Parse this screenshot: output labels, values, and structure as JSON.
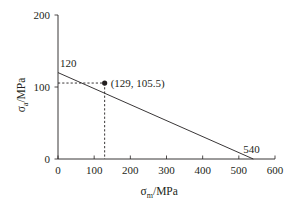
{
  "chart_data": {
    "type": "line",
    "title": "",
    "xlabel": "σm/MPa",
    "ylabel": "σa/MPa",
    "xlabel_main": "σ",
    "xlabel_sub": "m",
    "xlabel_unit": "/MPa",
    "ylabel_main": "σ",
    "ylabel_sub": "a",
    "ylabel_unit": "/MPa",
    "xlim": [
      0,
      600
    ],
    "ylim": [
      0,
      200
    ],
    "x_ticks": [
      0,
      100,
      200,
      300,
      400,
      500,
      600
    ],
    "x_tick_labels": [
      "0",
      "100",
      "200",
      "300",
      "400",
      "500",
      "600"
    ],
    "y_ticks": [
      0,
      100,
      200
    ],
    "y_tick_labels": [
      "0",
      "100",
      "200"
    ],
    "grid": false,
    "series": [
      {
        "name": "Goodman line",
        "x": [
          0,
          540
        ],
        "y": [
          120,
          0
        ],
        "style": "solid"
      }
    ],
    "point": {
      "x": 129,
      "y": 105.5,
      "label": "(129, 105.5)"
    },
    "annotations": [
      {
        "text": "120",
        "x": 0,
        "y": 120
      },
      {
        "text": "540",
        "x": 540,
        "y": 0
      }
    ],
    "guides": [
      {
        "from": [
          0,
          105.5
        ],
        "to": [
          129,
          105.5
        ],
        "style": "dashed"
      },
      {
        "from": [
          129,
          105.5
        ],
        "to": [
          129,
          0
        ],
        "style": "dashed"
      }
    ]
  },
  "colors": {
    "axis": "#231f20",
    "line": "#231f20"
  }
}
